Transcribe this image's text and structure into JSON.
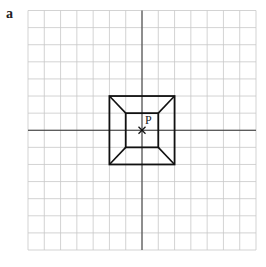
{
  "panel_label": "a",
  "point_label": "P",
  "grid": {
    "columns": 14,
    "rows": 14,
    "left": 28,
    "top": 10.5,
    "right": 256,
    "bottom": 250,
    "origin_col": 7,
    "origin_row": 7,
    "grid_color": "#c8c8c8",
    "axis_color": "#333333"
  },
  "shapes": {
    "outer_square": {
      "x1": -2,
      "y1": -2,
      "x2": 2,
      "y2": 2
    },
    "inner_square": {
      "x1": -1,
      "y1": -1,
      "x2": 1,
      "y2": 1
    },
    "line_color": "#111111"
  },
  "center_point": {
    "x": 0,
    "y": 0,
    "marker": "x"
  }
}
